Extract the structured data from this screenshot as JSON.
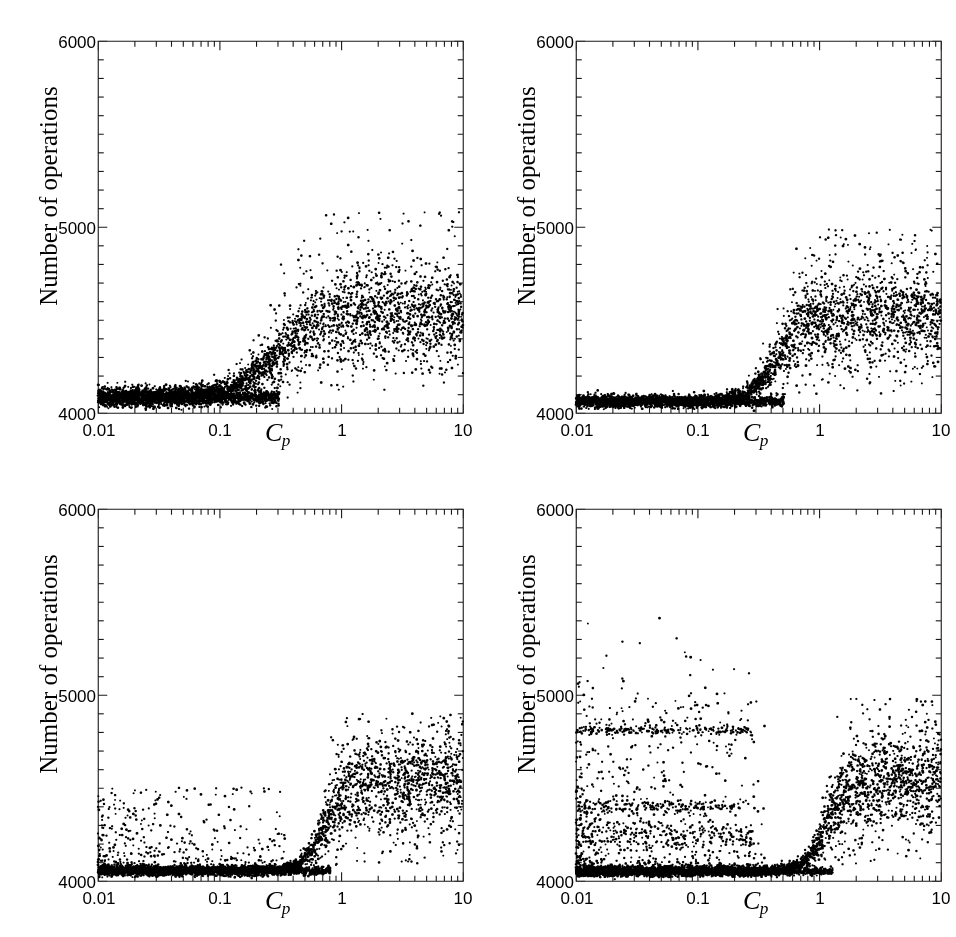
{
  "figure": {
    "title": "",
    "layout": "2x2 grid of scatter panels",
    "panel_count": 4,
    "background_color": "#ffffff",
    "point_color": "#000000"
  },
  "axis": {
    "ylabel": "Number of operations",
    "xlabel_main": "C",
    "xlabel_sub": "p",
    "ytick_labels": [
      "6000",
      "5000",
      "4000"
    ],
    "ytick_values": [
      6000,
      5000,
      4000
    ],
    "xtick_labels": [
      "0.01",
      "0.1",
      "1",
      "10"
    ],
    "xtick_values": [
      0.01,
      0.1,
      1,
      10
    ],
    "ylim": [
      4000,
      6000
    ],
    "xlim": [
      0.01,
      10
    ],
    "xscale": "log",
    "yscale": "linear",
    "y_minor_tick_step": 100,
    "grid": false,
    "legend": false
  },
  "chart_data": [
    {
      "type": "scatter",
      "panel": "top-left",
      "panel_index": 0,
      "title": "",
      "xlabel": "C_p",
      "ylabel": "Number of operations",
      "xscale": "log",
      "xlim": [
        0.01,
        10
      ],
      "ylim": [
        4000,
        6000
      ],
      "grid": false,
      "n_points": 3200,
      "seed": 11,
      "description": "Dense low plateau near 4080 for Cp<0.2, rising transition near Cp=0.25, broad cloud centered ~4500 with spread up to ~5050 for Cp>0.5",
      "model": {
        "baseline": 4085,
        "baseline_sigma": 28,
        "plateau": 4520,
        "plateau_sigma": 115,
        "transition_log_center": -0.56,
        "transition_log_width": 0.17,
        "upper_tail": 5080
      }
    },
    {
      "type": "scatter",
      "panel": "top-right",
      "panel_index": 1,
      "title": "",
      "xlabel": "C_p",
      "ylabel": "Number of operations",
      "xscale": "log",
      "xlim": [
        0.01,
        10
      ],
      "ylim": [
        4000,
        6000
      ],
      "grid": false,
      "n_points": 3200,
      "seed": 29,
      "description": "Very tight baseline near 4060 with sparse low outliers, sharp transition near Cp=0.45, cloud centered ~4520 reaching ~4980",
      "model": {
        "baseline": 4062,
        "baseline_sigma": 18,
        "plateau": 4525,
        "plateau_sigma": 125,
        "transition_log_center": -0.34,
        "transition_log_width": 0.12,
        "upper_tail": 4990
      }
    },
    {
      "type": "scatter",
      "panel": "bottom-left",
      "panel_index": 2,
      "title": "",
      "xlabel": "C_p",
      "ylabel": "Number of operations",
      "xscale": "log",
      "xlim": [
        0.01,
        10
      ],
      "ylim": [
        4000,
        6000
      ],
      "grid": false,
      "n_points": 3200,
      "seed": 47,
      "description": "Extremely tight baseline near 4055 with a sparse upward spray of outliers for Cp<0.08, abrupt transition near Cp=0.7, cloud centered ~4520 reaching ~4880",
      "model": {
        "baseline": 4055,
        "baseline_sigma": 14,
        "plateau": 4520,
        "plateau_sigma": 125,
        "transition_log_center": -0.14,
        "transition_log_width": 0.09,
        "upper_tail": 4900,
        "low_cp_spray": true
      }
    },
    {
      "type": "scatter",
      "panel": "bottom-right",
      "panel_index": 3,
      "title": "",
      "xlabel": "C_p",
      "ylabel": "Number of operations",
      "xscale": "log",
      "xlim": [
        0.01,
        10
      ],
      "ylim": [
        4000,
        6000
      ],
      "grid": false,
      "n_points": 3400,
      "seed": 73,
      "description": "Tight baseline near 4055, plus horizontal bands at about 4810 and 4400 spanning Cp from 0.01 to ~0.3, diffuse outliers between, transition near Cp=1.1, cloud centered ~4520 reaching ~4960",
      "model": {
        "baseline": 4052,
        "baseline_sigma": 14,
        "plateau": 4530,
        "plateau_sigma": 125,
        "transition_log_center": 0.06,
        "transition_log_width": 0.09,
        "upper_tail": 4980,
        "bands": [
          {
            "level": 4810,
            "sigma": 12,
            "log_x_max": -0.55,
            "count": 210
          },
          {
            "level": 4400,
            "sigma": 22,
            "log_x_max": -0.62,
            "count": 190
          },
          {
            "level": 4250,
            "sigma": 40,
            "log_x_max": -0.55,
            "count": 240
          }
        ],
        "low_cp_spray": true
      }
    }
  ]
}
